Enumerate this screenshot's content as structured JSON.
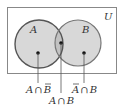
{
  "diagram": {
    "type": "venn",
    "universe_label": "U",
    "sets": [
      {
        "name": "A",
        "label": "A"
      },
      {
        "name": "B",
        "label": "B"
      }
    ],
    "regions": [
      {
        "id": "a-not-b",
        "label_parts": [
          "A",
          "∩",
          "B"
        ],
        "overlined": [
          false,
          false,
          true
        ]
      },
      {
        "id": "a-and-b",
        "label_parts": [
          "A",
          "∩",
          "B"
        ],
        "overlined": [
          false,
          false,
          false
        ]
      },
      {
        "id": "not-a-and-b",
        "label_parts": [
          "A",
          "∩",
          "B"
        ],
        "overlined": [
          true,
          false,
          false
        ]
      }
    ],
    "colors": {
      "fill": "#d8d8d8",
      "overlap_fill": "#c4c4c4",
      "stroke": "#555555",
      "frame": "#888888",
      "text": "#333333"
    }
  }
}
